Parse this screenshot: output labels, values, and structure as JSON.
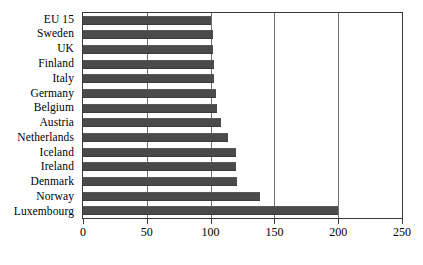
{
  "chart_data": {
    "type": "bar",
    "orientation": "horizontal",
    "title": "",
    "subtitle": "",
    "xlabel": "",
    "ylabel": "",
    "xlim": [
      0,
      250
    ],
    "ylim": null,
    "grid": true,
    "grid_axis": "x",
    "legend": false,
    "legend_position": "none",
    "xticks": [
      0,
      50,
      100,
      150,
      200,
      250
    ],
    "xtick_labels": [
      "0",
      "50",
      "100",
      "150",
      "200",
      "250"
    ],
    "categories": [
      "EU 15",
      "Sweden",
      "UK",
      "Finland",
      "Italy",
      "Germany",
      "Belgium",
      "Austria",
      "Netherlands",
      "Iceland",
      "Ireland",
      "Denmark",
      "Norway",
      "Luxembourg"
    ],
    "values": [
      100,
      102,
      102,
      103,
      103,
      104,
      105,
      108,
      114,
      120,
      120,
      121,
      139,
      200
    ],
    "series": [
      {
        "name": "value",
        "values": [
          100,
          102,
          102,
          103,
          103,
          104,
          105,
          108,
          114,
          120,
          120,
          121,
          139,
          200
        ]
      }
    ],
    "bar_color": "#4a4a4a",
    "plot_border_color": "#3a3a3a",
    "gridline_color": "#6f6f6f",
    "background_color": "#ffffff"
  }
}
